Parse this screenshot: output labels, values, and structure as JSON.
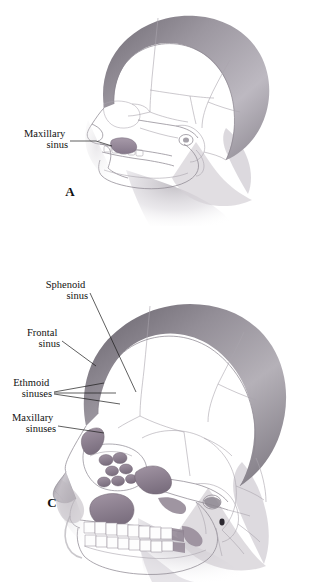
{
  "figure": {
    "kind": "anatomical-illustration",
    "background_color": "#ffffff",
    "ink_color": "#111111",
    "bone_line_color": "#8d8892",
    "suture_line_color": "#a9a4ad",
    "sinus_fill_color": "#9a8e9c",
    "sinus_fill_dark": "#7d7183",
    "soft_tissue_color": "#cfcbd2"
  },
  "panels": [
    {
      "id": "A",
      "letter": "A",
      "caption_letter_position": {
        "x": 70,
        "y": 196
      },
      "description": "Infant skull in lateral view; only a small maxillary sinus is present",
      "labels": [
        {
          "id": "maxillary-sinus-a",
          "lines": [
            "Maxillary",
            "sinus"
          ],
          "align": "end",
          "text_x": 68,
          "text_y": 137,
          "line_height": 11,
          "leader_points": "70,141 96,141 112,146"
        }
      ]
    },
    {
      "id": "C",
      "letter": "C",
      "caption_letter_position": {
        "x": 52,
        "y": 507
      },
      "description": "Adult skull in lateral view showing sphenoid, frontal, ethmoid and maxillary sinuses",
      "labels": [
        {
          "id": "sphenoid-sinus",
          "lines": [
            "Sphenoid",
            "sinus"
          ],
          "align": "end",
          "text_x": 88,
          "text_y": 288,
          "line_height": 11,
          "leader_points": "90,293 136,392"
        },
        {
          "id": "frontal-sinus",
          "lines": [
            "Frontal",
            "sinus"
          ],
          "align": "end",
          "text_x": 60,
          "text_y": 336,
          "line_height": 11,
          "leader_points": "62,341 96,366"
        },
        {
          "id": "ethmoid-sinuses",
          "lines": [
            "Ethmoid",
            "sinuses"
          ],
          "align": "end",
          "text_x": 52,
          "text_y": 386,
          "line_height": 11,
          "leader_points_multi": [
            "54,392 104,383",
            "54,393 116,393",
            "54,394 120,404"
          ]
        },
        {
          "id": "maxillary-sinuses",
          "lines": [
            "Maxillary",
            "sinuses"
          ],
          "align": "end",
          "text_x": 56,
          "text_y": 421,
          "line_height": 11,
          "leader_points": "58,426 104,433"
        }
      ]
    }
  ],
  "structures": {
    "sphenoid_sinus": "Sphenoid sinus",
    "frontal_sinus": "Frontal sinus",
    "ethmoid_sinuses": "Ethmoid sinuses",
    "maxillary_sinus": "Maxillary sinus",
    "maxillary_sinuses": "Maxillary sinuses"
  }
}
